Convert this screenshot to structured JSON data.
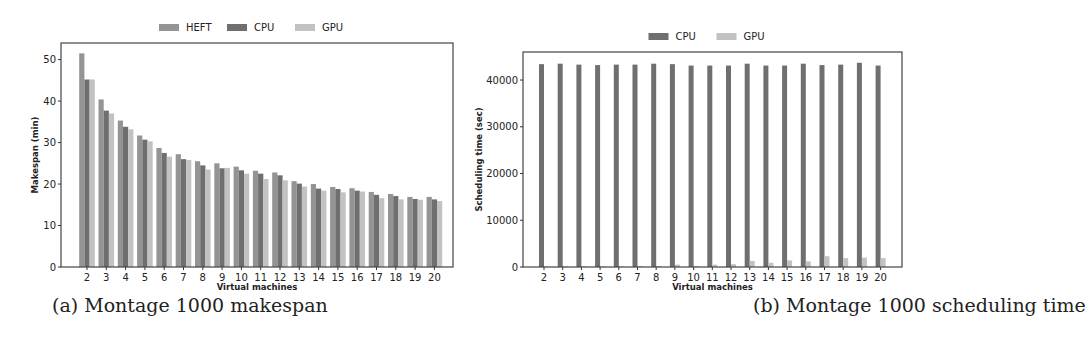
{
  "chart_data": [
    {
      "type": "bar",
      "title": "",
      "caption": "(a) Montage 1000 makespan",
      "xlabel": "Virtual machines",
      "ylabel": "Makespan (min)",
      "ylim": [
        0,
        54
      ],
      "yticks": [
        0,
        10,
        20,
        30,
        40,
        50
      ],
      "grid": false,
      "legend_position": "top-center-outside",
      "categories": [
        "2",
        "3",
        "4",
        "5",
        "6",
        "7",
        "8",
        "9",
        "10",
        "11",
        "12",
        "13",
        "14",
        "15",
        "16",
        "17",
        "18",
        "19",
        "20"
      ],
      "series": [
        {
          "name": "HEFT",
          "color": "#949494",
          "values": [
            51.5,
            40.4,
            35.3,
            31.7,
            28.7,
            27.2,
            25.5,
            25.0,
            24.2,
            23.2,
            22.8,
            20.7,
            20.0,
            19.3,
            19.0,
            18.1,
            17.6,
            16.9,
            16.9
          ]
        },
        {
          "name": "CPU",
          "color": "#6f6f6f",
          "values": [
            45.2,
            37.7,
            33.8,
            30.7,
            27.5,
            26.0,
            24.5,
            23.8,
            23.3,
            22.5,
            22.1,
            20.1,
            18.9,
            18.8,
            18.4,
            17.4,
            17.1,
            16.4,
            16.3
          ]
        },
        {
          "name": "GPU",
          "color": "#c2c2c2",
          "values": [
            45.2,
            37.0,
            33.2,
            30.3,
            26.6,
            25.8,
            23.5,
            23.9,
            22.5,
            21.2,
            20.9,
            19.4,
            18.4,
            18.0,
            18.2,
            16.6,
            16.3,
            16.2,
            15.9
          ]
        }
      ]
    },
    {
      "type": "bar",
      "title": "",
      "caption": "(b) Montage 1000 scheduling time",
      "xlabel": "Virtual machines",
      "ylabel": "Scheduling time (sec)",
      "ylim": [
        0,
        46000
      ],
      "yticks": [
        0,
        10000,
        20000,
        30000,
        40000
      ],
      "grid": false,
      "legend_position": "top-center-outside",
      "categories": [
        "2",
        "3",
        "4",
        "5",
        "6",
        "7",
        "8",
        "9",
        "10",
        "11",
        "12",
        "13",
        "14",
        "15",
        "16",
        "17",
        "18",
        "19",
        "20"
      ],
      "series": [
        {
          "name": "CPU",
          "color": "#6f6f6f",
          "values": [
            43400,
            43500,
            43300,
            43200,
            43300,
            43300,
            43500,
            43400,
            43100,
            43100,
            43100,
            43500,
            43100,
            43100,
            43500,
            43200,
            43300,
            43700,
            43100
          ]
        },
        {
          "name": "GPU",
          "color": "#c2c2c2",
          "values": [
            100,
            150,
            150,
            150,
            150,
            200,
            200,
            500,
            200,
            500,
            600,
            1300,
            900,
            1400,
            1200,
            2300,
            1900,
            2000,
            1900
          ]
        }
      ]
    }
  ],
  "captions": {
    "a": "(a) Montage 1000 makespan",
    "b": "(b) Montage 1000 scheduling time"
  }
}
